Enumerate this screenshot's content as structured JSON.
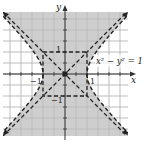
{
  "chart_data": {
    "type": "area",
    "title": "",
    "equation_label": "x² − y² = 1",
    "inequality_shaded": "x² − y² < 1",
    "xlabel": "x",
    "ylabel": "y",
    "xlim": [
      -2.8,
      2.8
    ],
    "ylim": [
      -2.8,
      2.8
    ],
    "grid": true,
    "grid_step": 0.5,
    "tick_labels": {
      "x": [
        "-1",
        "1"
      ],
      "y": [
        "1",
        "-1"
      ]
    },
    "curves": [
      {
        "name": "hyperbola",
        "equation": "x^2 - y^2 = 1",
        "style": "dashed",
        "vertices": [
          [
            -1,
            0
          ],
          [
            1,
            0
          ]
        ]
      },
      {
        "name": "asymptote",
        "equation": "y = x",
        "style": "dashed"
      },
      {
        "name": "asymptote",
        "equation": "y = -x",
        "style": "dashed"
      },
      {
        "name": "fundamental-rectangle",
        "corners": [
          [
            -1,
            1
          ],
          [
            1,
            1
          ],
          [
            1,
            -1
          ],
          [
            -1,
            -1
          ]
        ],
        "style": "dashed"
      }
    ],
    "colors": {
      "shade": "#c8c8c8",
      "grid": "#bdbdbd",
      "curve": "#222222"
    }
  },
  "labels": {
    "x_axis": "x",
    "y_axis": "y",
    "equation": "x² − y² = 1",
    "tick_pos_x": "1",
    "tick_neg_x": "−1",
    "tick_pos_y": "1",
    "tick_neg_y": "−1"
  }
}
